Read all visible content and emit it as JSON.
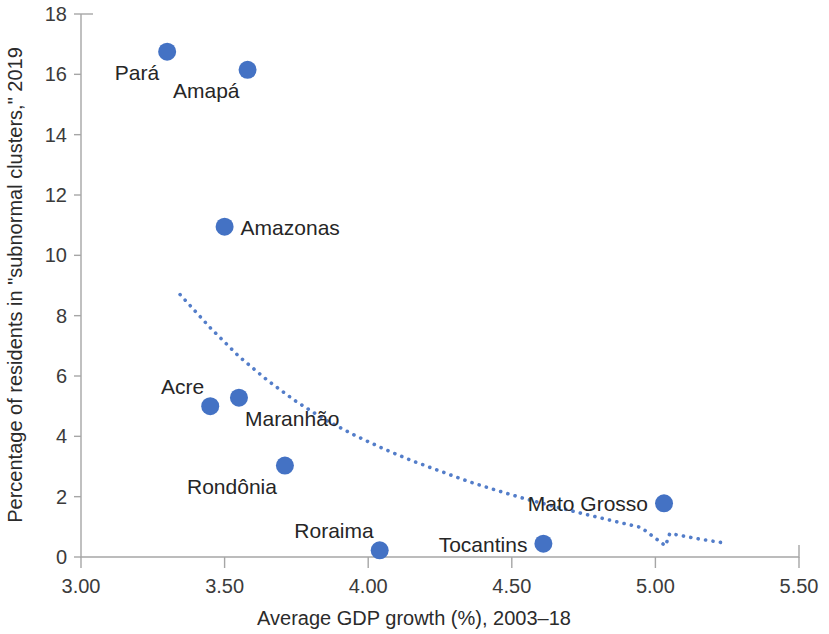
{
  "chart_data": {
    "type": "scatter",
    "title": "",
    "xlabel": "Average GDP growth (%), 2003–18",
    "ylabel": "Percentage of residents in \"subnormal clusters,\" 2019",
    "xlim": [
      3.0,
      5.5
    ],
    "ylim": [
      0,
      18
    ],
    "xticks": [
      "3.00",
      "3.50",
      "4.00",
      "4.50",
      "5.00",
      "5.50"
    ],
    "xtick_values": [
      3.0,
      3.5,
      4.0,
      4.5,
      5.0,
      5.5
    ],
    "yticks": [
      "0",
      "2",
      "4",
      "6",
      "8",
      "10",
      "12",
      "14",
      "16",
      "18"
    ],
    "ytick_values": [
      0,
      2,
      4,
      6,
      8,
      10,
      12,
      14,
      16,
      18
    ],
    "grid": false,
    "legend": "none",
    "marker_color": "#4472c4",
    "trend_color": "#4472c4",
    "points": [
      {
        "label": "Pará",
        "x": 3.3,
        "y": 16.75,
        "label_pos": "below-left"
      },
      {
        "label": "Amapá",
        "x": 3.58,
        "y": 16.15,
        "label_pos": "below-left"
      },
      {
        "label": "Amazonas",
        "x": 3.5,
        "y": 10.95,
        "label_pos": "right"
      },
      {
        "label": "Acre",
        "x": 3.45,
        "y": 5.0,
        "label_pos": "above-left"
      },
      {
        "label": "Maranhão",
        "x": 3.55,
        "y": 5.28,
        "label_pos": "below-right"
      },
      {
        "label": "Rondônia",
        "x": 3.71,
        "y": 3.03,
        "label_pos": "below-left"
      },
      {
        "label": "Roraima",
        "x": 4.04,
        "y": 0.22,
        "label_pos": "above-left"
      },
      {
        "label": "Tocantins",
        "x": 4.61,
        "y": 0.44,
        "label_pos": "left"
      },
      {
        "label": "Mato Grosso",
        "x": 5.03,
        "y": 1.78,
        "label_pos": "left"
      }
    ],
    "trend": {
      "type": "power-fit-dotted",
      "points": [
        {
          "x": 3.345,
          "y": 8.7
        },
        {
          "x": 3.45,
          "y": 7.6
        },
        {
          "x": 3.55,
          "y": 6.65
        },
        {
          "x": 3.65,
          "y": 5.85
        },
        {
          "x": 3.75,
          "y": 5.15
        },
        {
          "x": 3.85,
          "y": 4.55
        },
        {
          "x": 3.95,
          "y": 4.05
        },
        {
          "x": 4.05,
          "y": 3.6
        },
        {
          "x": 4.15,
          "y": 3.2
        },
        {
          "x": 4.25,
          "y": 2.85
        },
        {
          "x": 4.35,
          "y": 2.5
        },
        {
          "x": 4.45,
          "y": 2.2
        },
        {
          "x": 4.55,
          "y": 1.92
        },
        {
          "x": 4.65,
          "y": 1.67
        },
        {
          "x": 4.75,
          "y": 1.43
        },
        {
          "x": 4.85,
          "y": 1.2
        },
        {
          "x": 4.95,
          "y": 0.98
        },
        {
          "x": 5.05,
          "y": 0.78
        },
        {
          "x": 5.15,
          "y": 0.6
        },
        {
          "x": 5.25,
          "y": 0.45
        },
        {
          "x": 5.035,
          "y": 0.37
        }
      ]
    }
  }
}
